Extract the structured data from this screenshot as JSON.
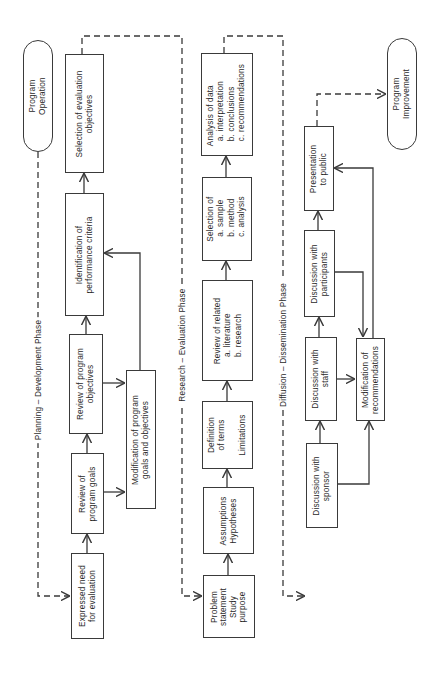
{
  "diagram": {
    "orientation": "rotated-90-counterclockwise",
    "phases": [
      {
        "id": "planning",
        "label": "Planning – Development Phase"
      },
      {
        "id": "research",
        "label": "Research – Evaluation Phase"
      },
      {
        "id": "diffusion",
        "label": "Diffusion – Dissemination Phase"
      }
    ],
    "terminals": {
      "start": "Program\nOperation",
      "end": "Program\nImprovement"
    },
    "planning": {
      "expressed_need": "Expressed need\nfor evaluation",
      "review_goals": "Review of\nprogram goals",
      "review_objectives": "Review of program\nobjectives",
      "identification": "Identification of\nperformance criteria",
      "selection_objectives": "Selection of evaluation\nobjectives",
      "modification_goals": "Modification of program\ngoals and objectives"
    },
    "research": {
      "problem_statement": "Problem\nstatement\nStudy\npurpose",
      "assumptions": "Assumptions\nHypotheses",
      "definition": "Definition\nof terms\n\nLimitations",
      "review_related": "Review of related\n   a. literature\n   b. research",
      "selection_of": "Selection of\n  a. sample\n  b. method\n  c. analysis",
      "analysis_data": "Analysis of data\n  a. interpretation\n  b. conclusions\n  c. recommendations"
    },
    "diffusion": {
      "sponsor": "Discussion with\nsponsor",
      "staff": "Discussion with\nstaff",
      "participants": "Discussion with\nparticipants",
      "presentation": "Presentation\nto public",
      "modification_recs": "Modification of\nrecommendations"
    },
    "colors": {
      "line": "#3a3a3a",
      "background": "#ffffff"
    }
  }
}
